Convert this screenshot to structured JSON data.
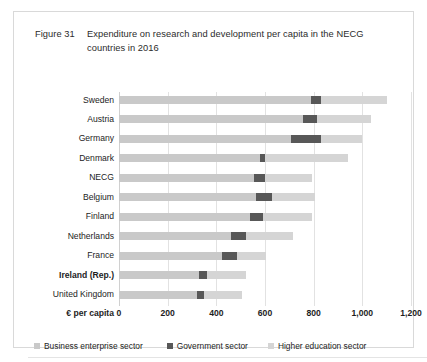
{
  "figure": {
    "number": "Figure 31",
    "caption": "Expenditure on research and development per capita in the NECG countries in 2016"
  },
  "axis": {
    "caption": "€ per capita",
    "ticks": [
      "0",
      "200",
      "400",
      "600",
      "800",
      "1,000",
      "1,200"
    ]
  },
  "legend": {
    "items": [
      {
        "label": "Business enterprise sector",
        "color": "#c9c9c9"
      },
      {
        "label": "Government sector",
        "color": "#585858"
      },
      {
        "label": "Higher education sector",
        "color": "#d5d5d5"
      }
    ]
  },
  "chart_data": {
    "type": "bar",
    "orientation": "horizontal",
    "stacked": true,
    "title": "Expenditure on research and development per capita in the NECG countries in 2016",
    "xlabel": "€ per capita",
    "ylabel": "",
    "xlim": [
      0,
      1200
    ],
    "xticks": [
      0,
      200,
      400,
      600,
      800,
      1000,
      1200
    ],
    "grid": true,
    "legend_position": "bottom",
    "categories": [
      "Sweden",
      "Austria",
      "Germany",
      "Denmark",
      "NECG",
      "Belgium",
      "Finland",
      "Netherlands",
      "France",
      "Ireland (Rep.)",
      "United Kingdom"
    ],
    "highlighted_category": "Ireland (Rep.)",
    "series": [
      {
        "name": "Business enterprise sector",
        "color": "#c9c9c9",
        "values": [
          790,
          755,
          705,
          580,
          555,
          565,
          540,
          460,
          425,
          330,
          320
        ]
      },
      {
        "name": "Government sector",
        "color": "#585858",
        "values": [
          40,
          60,
          125,
          20,
          45,
          65,
          50,
          60,
          60,
          30,
          30
        ]
      },
      {
        "name": "Higher education sector",
        "color": "#d5d5d5",
        "values": [
          270,
          220,
          170,
          340,
          195,
          175,
          205,
          195,
          120,
          160,
          155
        ]
      }
    ],
    "totals": [
      1100,
      1035,
      1000,
      940,
      795,
      805,
      795,
      715,
      605,
      520,
      505
    ]
  }
}
